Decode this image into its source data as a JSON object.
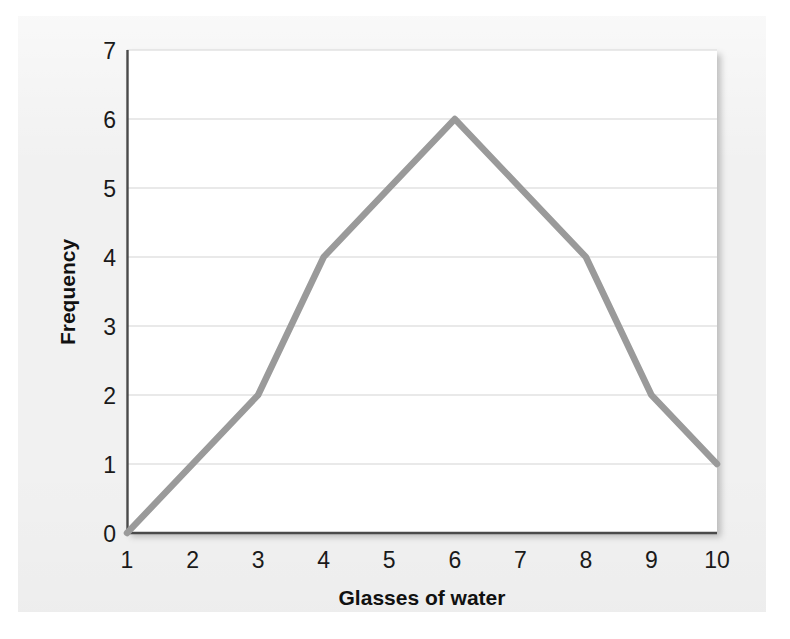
{
  "chart_data": {
    "type": "line",
    "title": "",
    "subtitle": "",
    "xlabel": "Glasses of water",
    "ylabel": "Frequency",
    "x": [
      1,
      2,
      3,
      4,
      5,
      6,
      7,
      8,
      9,
      10
    ],
    "values": [
      0,
      1,
      2,
      4,
      5,
      6,
      5,
      4,
      2,
      1
    ],
    "series": [
      {
        "name": "Frequency",
        "values": [
          0,
          1,
          2,
          4,
          5,
          6,
          5,
          4,
          2,
          1
        ],
        "color": "#9a9a9a"
      }
    ],
    "xlim": [
      1,
      10
    ],
    "ylim": [
      0,
      7
    ],
    "xticks": [
      "1",
      "2",
      "3",
      "4",
      "5",
      "6",
      "7",
      "8",
      "9",
      "10"
    ],
    "yticks": [
      "0",
      "1",
      "2",
      "3",
      "4",
      "5",
      "6",
      "7"
    ],
    "grid": "horizontal",
    "legend": "none",
    "markers": "none",
    "annotations": []
  },
  "style": {
    "line_color": "#9a9a9a",
    "grid_color": "#e2e2e2",
    "axis_color": "#4a4a4a",
    "plot_background": "#ffffff",
    "panel_background": "#f1f1f1",
    "text_color": "#1a1a1a"
  },
  "layout": {
    "plot_left": 127,
    "plot_top": 50,
    "plot_right": 717,
    "plot_bottom": 533
  }
}
